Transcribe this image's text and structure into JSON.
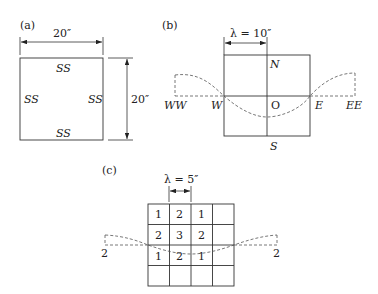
{
  "panel_a": {
    "label": "(a)",
    "width_dim": "20″",
    "height_dim": "20″",
    "edges": {
      "top": "SS",
      "left": "SS",
      "right": "SS",
      "bottom": "SS"
    }
  },
  "panel_b": {
    "label": "(b)",
    "lambda_dim": "λ = 10″",
    "points": {
      "north": "N",
      "south": "S",
      "origin": "O",
      "west": "W",
      "east": "E",
      "west_west": "WW",
      "east_east": "EE"
    }
  },
  "panel_c": {
    "label": "(c)",
    "lambda_dim": "λ = 5″",
    "grid": [
      [
        "1",
        "2",
        "1",
        ""
      ],
      [
        "2",
        "3",
        "2",
        ""
      ],
      [
        "1",
        "2",
        "1",
        ""
      ],
      [
        "",
        "",
        "",
        ""
      ]
    ],
    "left_label": "2",
    "right_label": "2"
  }
}
